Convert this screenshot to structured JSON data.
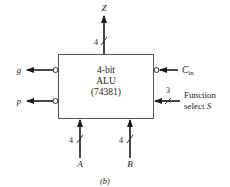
{
  "figure": {
    "caption": "(b)",
    "block": {
      "line1": "4-bit",
      "line2": "ALU",
      "line3": "(74381)"
    },
    "outputs": {
      "z": {
        "label": "Z",
        "width": "4"
      },
      "g": {
        "label": "g"
      },
      "p": {
        "label": "p"
      }
    },
    "inputs": {
      "cin": {
        "label_main": "C",
        "label_sub": "in"
      },
      "function_select": {
        "width": "3",
        "line1": "Function",
        "line2": "select S_pre",
        "label_line2_text": "select ",
        "label_line2_var": "S"
      },
      "a": {
        "label": "A",
        "width": "4"
      },
      "b": {
        "label": "B",
        "width": "4"
      }
    },
    "colors": {
      "line": "#1a1a1a",
      "box_border": "#555555",
      "background": "#ffffff"
    }
  }
}
